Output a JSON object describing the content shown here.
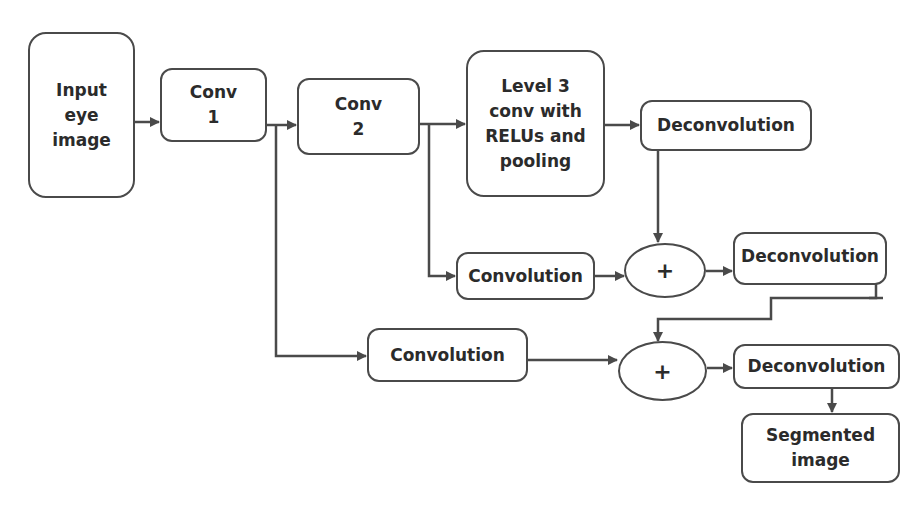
{
  "diagram": {
    "nodes": {
      "input": {
        "label": "Input\neye\nimage"
      },
      "conv1": {
        "label": "Conv\n1"
      },
      "conv2": {
        "label": "Conv\n2"
      },
      "level3": {
        "label": "Level 3\nconv with\nRELUs and\npooling"
      },
      "deconv1": {
        "label": "Deconvolution"
      },
      "conv_mid": {
        "label": "Convolution"
      },
      "sum1": {
        "label": "+"
      },
      "deconv2": {
        "label": "Deconvolution"
      },
      "conv_bottom": {
        "label": "Convolution"
      },
      "sum2": {
        "label": "+"
      },
      "deconv3": {
        "label": "Deconvolution"
      },
      "output": {
        "label": "Segmented\nimage"
      }
    },
    "edges": [
      [
        "input",
        "conv1"
      ],
      [
        "conv1",
        "conv2"
      ],
      [
        "conv2",
        "level3"
      ],
      [
        "level3",
        "deconv1"
      ],
      [
        "deconv1",
        "sum1"
      ],
      [
        "conv2",
        "conv_mid"
      ],
      [
        "conv_mid",
        "sum1"
      ],
      [
        "sum1",
        "deconv2"
      ],
      [
        "deconv2",
        "sum2"
      ],
      [
        "conv1",
        "conv_bottom"
      ],
      [
        "conv_bottom",
        "sum2"
      ],
      [
        "sum2",
        "deconv3"
      ],
      [
        "deconv3",
        "output"
      ]
    ],
    "line_color": "#4a4a4a"
  }
}
